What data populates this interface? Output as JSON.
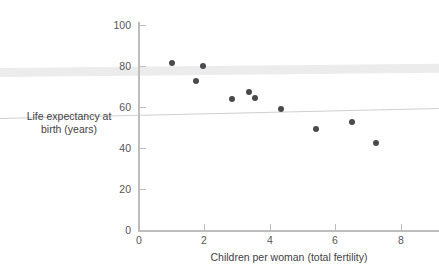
{
  "chart_data": {
    "type": "scatter",
    "title": "",
    "xlabel": "Children per woman (total fertility)",
    "ylabel": "Life expectancy at birth (years)",
    "ylabel_line1": "Life expectancy at",
    "ylabel_line2": "birth (years)",
    "xlim": [
      0,
      8.8
    ],
    "ylim": [
      0,
      107
    ],
    "xticks": [
      0,
      2,
      4,
      6,
      8
    ],
    "xticklabels": [
      "0",
      "2",
      "4",
      "6",
      "8"
    ],
    "yticks": [
      0,
      20,
      40,
      60,
      80,
      100
    ],
    "yticklabels": [
      "0",
      "20",
      "40",
      "60",
      "80",
      "100"
    ],
    "grid": false,
    "legend": null,
    "point_color": "#4a4a4d",
    "axis_color": "#bdbdbd",
    "points": [
      {
        "x": 1.0,
        "y": 81.5
      },
      {
        "x": 1.75,
        "y": 72.5
      },
      {
        "x": 1.95,
        "y": 80.0
      },
      {
        "x": 2.85,
        "y": 64.0
      },
      {
        "x": 3.35,
        "y": 67.5
      },
      {
        "x": 3.55,
        "y": 64.5
      },
      {
        "x": 4.35,
        "y": 59.0
      },
      {
        "x": 5.4,
        "y": 49.5
      },
      {
        "x": 6.5,
        "y": 52.5
      },
      {
        "x": 7.25,
        "y": 42.5
      }
    ]
  },
  "decorations": {
    "thick_band_label": "horizontal-gray-band",
    "thin_line_label": "horizontal-gray-rule"
  }
}
